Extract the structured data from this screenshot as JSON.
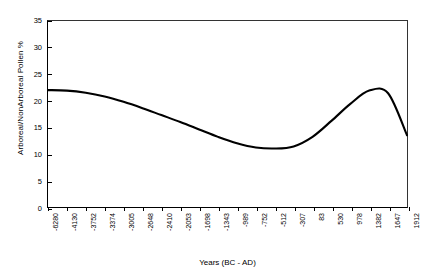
{
  "chart_data": {
    "type": "line",
    "title": "",
    "xlabel": "Years (BC - AD)",
    "ylabel": "Arboreal/NonArboreal Pollen %",
    "ylim": [
      0,
      35
    ],
    "yticks": [
      0,
      5,
      10,
      15,
      20,
      25,
      30,
      35
    ],
    "ytick_labels": [
      "0",
      "5",
      "10",
      "15",
      "20",
      "25",
      "30",
      "35"
    ],
    "grid": false,
    "legend": "none",
    "line_color": "#000000",
    "categories": [
      "-6280",
      "-4130",
      "-3752",
      "-3374",
      "-3005",
      "-2648",
      "-2410",
      "-2053",
      "-1698",
      "-1343",
      "-989",
      "-752",
      "-512",
      "-307",
      "83",
      "530",
      "978",
      "1382",
      "1647",
      "1912"
    ],
    "values": [
      22.0,
      21.9,
      21.5,
      20.8,
      19.8,
      18.6,
      17.3,
      16.0,
      14.6,
      13.2,
      12.0,
      11.2,
      11.0,
      11.4,
      13.2,
      16.2,
      19.4,
      21.9,
      21.4,
      13.5
    ],
    "series": [
      {
        "name": "Arboreal/NonArboreal Pollen %",
        "values": [
          22.0,
          21.9,
          21.5,
          20.8,
          19.8,
          18.6,
          17.3,
          16.0,
          14.6,
          13.2,
          12.0,
          11.2,
          11.0,
          11.4,
          13.2,
          16.2,
          19.4,
          21.9,
          21.4,
          13.5
        ]
      }
    ],
    "annotations": []
  }
}
